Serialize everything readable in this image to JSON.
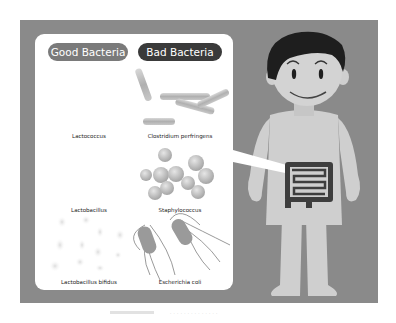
{
  "legend": {
    "good_label": "Good Bacteria",
    "bad_label": "Bad Bacteria"
  },
  "good_bacteria": [
    {
      "name": "Lactococcus"
    },
    {
      "name": "Lactobacillus"
    },
    {
      "name": "Lactobacillus bifidus"
    }
  ],
  "bad_bacteria": [
    {
      "name": "Clostridium perfringens"
    },
    {
      "name": "Staphylococcus"
    },
    {
      "name": "Escherichia coli"
    }
  ],
  "colors": {
    "frame": "#8a8a8a",
    "good_pill": "#7a7a7a",
    "bad_pill": "#3a3a3a",
    "skin": "#cfcfcf",
    "hair": "#1e1e1e",
    "intestine": "#3e3e3e"
  },
  "caption": "· · · · · · · · · · · · · ·"
}
